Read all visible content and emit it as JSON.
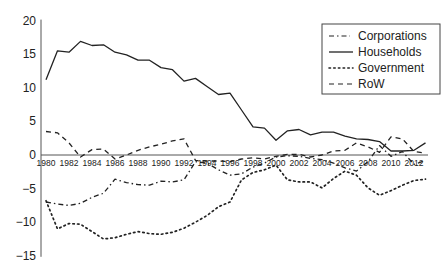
{
  "chart_data": {
    "type": "line",
    "title": "",
    "xlabel": "",
    "ylabel": "",
    "ylim": [
      -15,
      20
    ],
    "xlim": [
      1980,
      2013
    ],
    "yticks": [
      20,
      15,
      10,
      5,
      0,
      -5,
      -10,
      -15
    ],
    "xtick_labels": [
      "1980",
      "1982",
      "1984",
      "1986",
      "1988",
      "1990",
      "1992",
      "1994",
      "1996",
      "1998",
      "2000",
      "2002",
      "2004",
      "2006",
      "2008",
      "2010",
      "2012"
    ],
    "grid": false,
    "legend_position": "upper right",
    "x": [
      1980,
      1981,
      1982,
      1983,
      1984,
      1985,
      1986,
      1987,
      1988,
      1989,
      1990,
      1991,
      1992,
      1993,
      1994,
      1995,
      1996,
      1997,
      1998,
      1999,
      2000,
      2001,
      2002,
      2003,
      2004,
      2005,
      2006,
      2007,
      2008,
      2009,
      2010,
      2011,
      2012,
      2013
    ],
    "series": [
      {
        "name": "Corporations",
        "style": "dash-dot",
        "values": [
          -7.0,
          -7.3,
          -7.5,
          -7.2,
          -6.3,
          -5.7,
          -3.6,
          -4.1,
          -4.4,
          -4.5,
          -3.9,
          -4.0,
          -3.7,
          -1.0,
          -1.2,
          -2.2,
          -3.0,
          -2.8,
          -1.8,
          -1.2,
          -0.3,
          -0.1,
          -0.2,
          -0.5,
          -0.7,
          -1.2,
          -1.9,
          -2.4,
          -1.0,
          1.4,
          -0.2,
          0.5,
          -1.4,
          -0.8
        ]
      },
      {
        "name": "Households",
        "style": "solid",
        "values": [
          11.2,
          15.5,
          15.3,
          16.9,
          16.3,
          16.4,
          15.3,
          14.9,
          14.1,
          14.1,
          13.0,
          12.7,
          11.0,
          11.4,
          10.2,
          9.0,
          9.2,
          6.7,
          4.2,
          4.0,
          2.2,
          3.6,
          3.8,
          3.0,
          3.4,
          3.4,
          2.8,
          2.4,
          2.3,
          2.0,
          0.6,
          0.6,
          0.7,
          1.8
        ]
      },
      {
        "name": "Government",
        "style": "dotted",
        "values": [
          -6.8,
          -11.0,
          -10.2,
          -10.3,
          -11.4,
          -12.5,
          -12.3,
          -11.8,
          -11.4,
          -11.7,
          -11.8,
          -11.5,
          -10.9,
          -10.0,
          -9.0,
          -7.7,
          -7.0,
          -3.7,
          -2.6,
          -2.2,
          -1.5,
          -3.7,
          -4.0,
          -4.0,
          -4.9,
          -3.5,
          -2.4,
          -3.0,
          -4.9,
          -6.0,
          -5.3,
          -4.5,
          -3.8,
          -3.6
        ]
      },
      {
        "name": "RoW",
        "style": "dashed",
        "values": [
          3.5,
          3.3,
          1.8,
          -0.3,
          0.8,
          0.9,
          -0.6,
          0.0,
          0.7,
          1.2,
          1.6,
          2.1,
          2.4,
          -0.8,
          -0.9,
          -0.9,
          -1.0,
          -0.6,
          -0.4,
          -0.6,
          -0.2,
          0.1,
          0.1,
          -0.3,
          0.0,
          0.6,
          0.7,
          1.8,
          1.2,
          0.4,
          2.7,
          2.4,
          0.5,
          0.3
        ]
      }
    ]
  },
  "legend": {
    "items": [
      {
        "label": "Corporations",
        "style": "dash-dot"
      },
      {
        "label": "Households",
        "style": "solid"
      },
      {
        "label": "Government",
        "style": "dotted"
      },
      {
        "label": "RoW",
        "style": "dashed"
      }
    ]
  },
  "colors": {
    "line": "#222222",
    "axis": "#555555",
    "legend_border": "#444444"
  }
}
